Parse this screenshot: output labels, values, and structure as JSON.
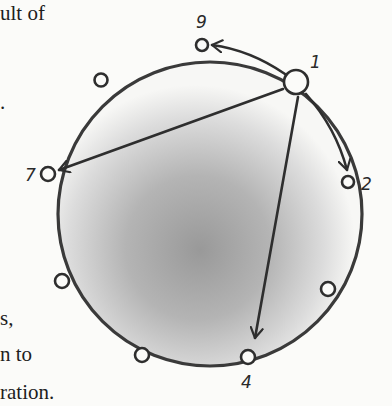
{
  "text_fragments": [
    {
      "id": "frag-1",
      "text": "ult of",
      "x": 0,
      "y": 3
    },
    {
      "id": "frag-2",
      "text": ".",
      "x": 0,
      "y": 92
    },
    {
      "id": "frag-3",
      "text": "s,",
      "x": 0,
      "y": 308
    },
    {
      "id": "frag-4",
      "text": "n to",
      "x": 0,
      "y": 344
    },
    {
      "id": "frag-5",
      "text": "ration.",
      "x": 0,
      "y": 382
    }
  ],
  "diagram": {
    "ring": {
      "cx": 210,
      "cy": 214,
      "r": 152,
      "stroke": "#3a3a3a"
    },
    "shading": {
      "center_x": 200,
      "center_y": 240,
      "dark": "#9a9a9a",
      "light": "#fbfbf9"
    },
    "nodes": [
      {
        "id": "1",
        "label": "1",
        "x": 296,
        "y": 82,
        "r": 12,
        "label_x": 310,
        "label_y": 64
      },
      {
        "id": "9",
        "label": "9",
        "x": 202,
        "y": 45,
        "r": 6,
        "label_x": 197,
        "label_y": 26
      },
      {
        "id": "u1",
        "label": "",
        "x": 101,
        "y": 80,
        "r": 6
      },
      {
        "id": "7",
        "label": "7",
        "x": 48,
        "y": 174,
        "r": 7,
        "label_x": 26,
        "label_y": 181
      },
      {
        "id": "u2",
        "label": "",
        "x": 62,
        "y": 281,
        "r": 7
      },
      {
        "id": "u3",
        "label": "",
        "x": 142,
        "y": 355,
        "r": 7
      },
      {
        "id": "4",
        "label": "4",
        "x": 248,
        "y": 357,
        "r": 7,
        "label_x": 242,
        "label_y": 387
      },
      {
        "id": "u4",
        "label": "",
        "x": 328,
        "y": 289,
        "r": 7
      },
      {
        "id": "2",
        "label": "2",
        "x": 348,
        "y": 182,
        "r": 6,
        "label_x": 363,
        "label_y": 190
      }
    ],
    "arrows": [
      {
        "from": "1",
        "to": "9",
        "type": "arc"
      },
      {
        "from": "1",
        "to": "2",
        "type": "arc"
      },
      {
        "from": "1",
        "to": "7",
        "type": "chord"
      },
      {
        "from": "1",
        "to": "4",
        "type": "chord"
      }
    ]
  }
}
